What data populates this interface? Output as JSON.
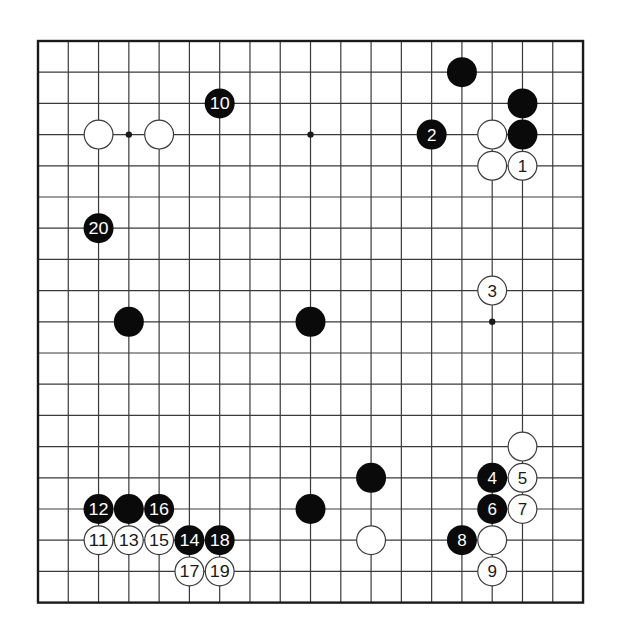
{
  "board": {
    "size": 19,
    "origin": {
      "x": 38,
      "y": 41
    },
    "spacing": {
      "x": 30.28,
      "y": 31.2
    },
    "stone_radius": 15,
    "colors": {
      "background": "#ffffff",
      "grid": "#3a3a3a",
      "frame": "#1a1a1a",
      "black_stone": "#0a0a0a",
      "white_stone": "#ffffff",
      "white_stone_outline": "#3a3a3a",
      "black_label": "#ffffff",
      "white_label": "#1a1a1a"
    },
    "star_points": [
      [
        3,
        3
      ],
      [
        9,
        3
      ],
      [
        15,
        3
      ],
      [
        3,
        9
      ],
      [
        9,
        9
      ],
      [
        15,
        9
      ],
      [
        3,
        15
      ],
      [
        9,
        15
      ],
      [
        15,
        15
      ]
    ]
  },
  "stones": [
    {
      "color": "black",
      "col": 14,
      "row": 1,
      "label": ""
    },
    {
      "color": "black",
      "col": 16,
      "row": 2,
      "label": ""
    },
    {
      "color": "black",
      "col": 16,
      "row": 3,
      "label": ""
    },
    {
      "color": "white",
      "col": 15,
      "row": 3,
      "label": ""
    },
    {
      "color": "black",
      "col": 13,
      "row": 3,
      "label": "2"
    },
    {
      "color": "white",
      "col": 15,
      "row": 4,
      "label": ""
    },
    {
      "color": "white",
      "col": 16,
      "row": 4,
      "label": "1"
    },
    {
      "color": "black",
      "col": 6,
      "row": 2,
      "label": "10"
    },
    {
      "color": "white",
      "col": 2,
      "row": 3,
      "label": ""
    },
    {
      "color": "white",
      "col": 4,
      "row": 3,
      "label": ""
    },
    {
      "color": "black",
      "col": 2,
      "row": 6,
      "label": "20"
    },
    {
      "color": "black",
      "col": 3,
      "row": 9,
      "label": ""
    },
    {
      "color": "black",
      "col": 9,
      "row": 9,
      "label": ""
    },
    {
      "color": "white",
      "col": 15,
      "row": 8,
      "label": "3"
    },
    {
      "color": "white",
      "col": 16,
      "row": 13,
      "label": ""
    },
    {
      "color": "black",
      "col": 15,
      "row": 14,
      "label": "4"
    },
    {
      "color": "white",
      "col": 16,
      "row": 14,
      "label": "5"
    },
    {
      "color": "black",
      "col": 15,
      "row": 15,
      "label": "6"
    },
    {
      "color": "white",
      "col": 16,
      "row": 15,
      "label": "7"
    },
    {
      "color": "black",
      "col": 14,
      "row": 16,
      "label": "8"
    },
    {
      "color": "white",
      "col": 15,
      "row": 16,
      "label": ""
    },
    {
      "color": "white",
      "col": 15,
      "row": 17,
      "label": "9"
    },
    {
      "color": "black",
      "col": 11,
      "row": 14,
      "label": ""
    },
    {
      "color": "black",
      "col": 9,
      "row": 15,
      "label": ""
    },
    {
      "color": "white",
      "col": 11,
      "row": 16,
      "label": ""
    },
    {
      "color": "black",
      "col": 2,
      "row": 15,
      "label": "12"
    },
    {
      "color": "black",
      "col": 3,
      "row": 15,
      "label": ""
    },
    {
      "color": "black",
      "col": 4,
      "row": 15,
      "label": "16"
    },
    {
      "color": "white",
      "col": 2,
      "row": 16,
      "label": "11"
    },
    {
      "color": "white",
      "col": 3,
      "row": 16,
      "label": "13"
    },
    {
      "color": "white",
      "col": 4,
      "row": 16,
      "label": "15"
    },
    {
      "color": "black",
      "col": 5,
      "row": 16,
      "label": "14"
    },
    {
      "color": "black",
      "col": 6,
      "row": 16,
      "label": "18"
    },
    {
      "color": "white",
      "col": 5,
      "row": 17,
      "label": "17"
    },
    {
      "color": "white",
      "col": 6,
      "row": 17,
      "label": "19"
    }
  ]
}
